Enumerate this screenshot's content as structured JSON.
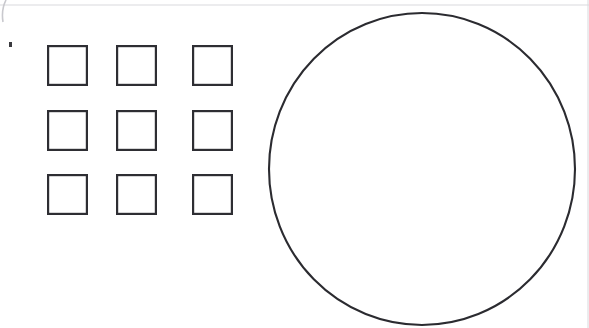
{
  "canvas": {
    "width": 589,
    "height": 328,
    "background_color": "#ffffff",
    "title": "Shapes diagram: square grid and circle"
  },
  "palette": {
    "stroke_dark": "#2e2e33",
    "stroke_circle": "#2b2b30",
    "scan_line": "#d9d9dd",
    "artifact": "#3a3a3f",
    "background": "#ffffff"
  },
  "square_grid": {
    "label": "3 by 3 grid of open squares",
    "rows": 3,
    "columns": 3,
    "square_size": 41,
    "gap_x": 35,
    "gap_y": 27,
    "origin_x": 47,
    "origin_y": 45,
    "stroke_width": 2.2,
    "fill": "#ffffff",
    "squares": [
      {
        "name": "square-r1c1",
        "x": 47,
        "y": 45,
        "w": 41,
        "h": 41
      },
      {
        "name": "square-r1c2",
        "x": 116,
        "y": 45,
        "w": 41,
        "h": 41
      },
      {
        "name": "square-r1c3",
        "x": 192,
        "y": 45,
        "w": 41,
        "h": 41
      },
      {
        "name": "square-r2c1",
        "x": 47,
        "y": 110,
        "w": 41,
        "h": 41
      },
      {
        "name": "square-r2c2",
        "x": 116,
        "y": 110,
        "w": 41,
        "h": 41
      },
      {
        "name": "square-r2c3",
        "x": 192,
        "y": 110,
        "w": 41,
        "h": 41
      },
      {
        "name": "square-r3c1",
        "x": 47,
        "y": 174,
        "w": 41,
        "h": 41
      },
      {
        "name": "square-r3c2",
        "x": 116,
        "y": 174,
        "w": 41,
        "h": 41
      },
      {
        "name": "square-r3c3",
        "x": 192,
        "y": 174,
        "w": 41,
        "h": 41
      }
    ]
  },
  "circle": {
    "label": "Large open circle",
    "center_x": 422,
    "center_y": 169,
    "radius_x": 153,
    "radius_y": 156,
    "stroke_width": 2.1,
    "fill": "#ffffff"
  },
  "artifacts": {
    "top_scan_line": {
      "x1": 0,
      "y1": 5,
      "x2": 589,
      "y2": 5
    },
    "right_scan_line": {
      "x1": 588,
      "y1": 0,
      "x2": 588,
      "y2": 328
    },
    "corner_dot": {
      "x": 9,
      "y": 42,
      "w": 3,
      "h": 5
    },
    "corner_arc": {
      "path": "M 6 0 Q 1 10 3 22"
    }
  }
}
